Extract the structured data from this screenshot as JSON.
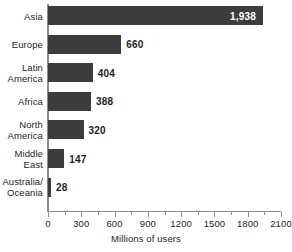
{
  "chart_data": {
    "type": "bar",
    "orientation": "horizontal",
    "title": "",
    "subtitle": "",
    "xlabel": "Millions of users",
    "ylabel": "",
    "categories": [
      "Asia",
      "Europe",
      "Latin America",
      "Africa",
      "North America",
      "Middle East",
      "Australia/ Oceania"
    ],
    "category_lines": [
      [
        "Asia"
      ],
      [
        "Europe"
      ],
      [
        "Latin",
        "America"
      ],
      [
        "Africa"
      ],
      [
        "North",
        "America"
      ],
      [
        "Middle",
        "East"
      ],
      [
        "Australia/",
        "Oceania"
      ]
    ],
    "values": [
      1938,
      660,
      404,
      388,
      320,
      147,
      28
    ],
    "value_labels": [
      "1,938",
      "660",
      "404",
      "388",
      "320",
      "147",
      "28"
    ],
    "label_placement": [
      "inside",
      "outside",
      "outside",
      "outside",
      "outside",
      "outside",
      "outside"
    ],
    "xlim": [
      0,
      2100
    ],
    "xticks": [
      0,
      300,
      600,
      900,
      1200,
      1500,
      1800,
      2100
    ],
    "xtick_labels": [
      "0",
      "300",
      "600",
      "900",
      "1200",
      "1500",
      "1800",
      "2100"
    ],
    "minor_xticks": [
      150,
      450,
      750,
      1050,
      1350,
      1650,
      1950
    ],
    "grid": false,
    "legend": null,
    "bar_color": "#3d3d3d",
    "axis_color": "#8b8b8b",
    "text_color": "#231f20",
    "inside_label_color": "#ffffff",
    "background": "#ffffff"
  }
}
